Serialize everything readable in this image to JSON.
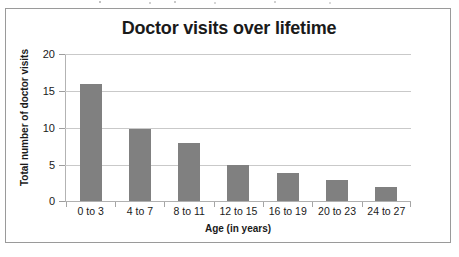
{
  "chart_data": {
    "type": "bar",
    "title": "Doctor visits over lifetime",
    "xlabel": "Age (in years)",
    "ylabel": "Total number of doctor visits",
    "categories": [
      "0 to 3",
      "4 to 7",
      "8 to 11",
      "12 to 15",
      "16 to 19",
      "20 to 23",
      "24 to 27"
    ],
    "values": [
      16,
      10,
      8,
      5,
      4,
      3,
      2
    ],
    "ylim": [
      0,
      20
    ],
    "ytick_labels": [
      "20",
      "15",
      "10",
      "5",
      "0"
    ],
    "ytick_values": [
      20,
      15,
      10,
      5,
      0
    ],
    "grid": true,
    "legend": "none",
    "bar_color": "#808080",
    "gridline_color": "#c9c9c9",
    "axis_color": "#b0b0b0",
    "text_color": "#1a1a1a",
    "border_color": "#9a9a9a"
  }
}
